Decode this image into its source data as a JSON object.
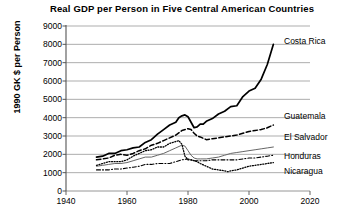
{
  "chart_data": {
    "type": "line",
    "title": "Real  GDP per Person in Five Central American Countries",
    "xlabel": "",
    "ylabel": "1990 GK $ per Person",
    "xlim": [
      1940,
      2020
    ],
    "ylim": [
      0,
      9000
    ],
    "xticks": [
      1940,
      1960,
      1980,
      2000,
      2020
    ],
    "yticks": [
      0,
      1000,
      2000,
      3000,
      4000,
      5000,
      6000,
      7000,
      8000,
      9000
    ],
    "grid": true,
    "legend_position": "right-inline-labels",
    "series": [
      {
        "name": "Costa Rica",
        "style": "solid-thick",
        "color": "#000000",
        "x": [
          1950,
          1952,
          1954,
          1956,
          1958,
          1960,
          1962,
          1964,
          1966,
          1968,
          1970,
          1972,
          1974,
          1976,
          1977,
          1978,
          1979,
          1980,
          1981,
          1982,
          1983,
          1984,
          1985,
          1986,
          1988,
          1990,
          1992,
          1994,
          1996,
          1998,
          2000,
          2002,
          2004,
          2006,
          2008
        ],
        "y": [
          1850,
          1900,
          2050,
          2050,
          2200,
          2250,
          2350,
          2400,
          2650,
          2800,
          3100,
          3350,
          3600,
          3750,
          4000,
          4100,
          4150,
          4050,
          3750,
          3450,
          3500,
          3650,
          3650,
          3800,
          3950,
          4200,
          4350,
          4600,
          4650,
          5150,
          5450,
          5600,
          6100,
          6900,
          8000
        ]
      },
      {
        "name": "Guatemala",
        "style": "dashed",
        "color": "#000000",
        "x": [
          1950,
          1952,
          1954,
          1956,
          1958,
          1960,
          1962,
          1964,
          1966,
          1968,
          1970,
          1972,
          1974,
          1976,
          1978,
          1980,
          1981,
          1982,
          1983,
          1984,
          1986,
          1988,
          1990,
          1992,
          1994,
          1996,
          1998,
          2000,
          2002,
          2004,
          2006,
          2008
        ],
        "y": [
          1700,
          1750,
          1800,
          1950,
          2000,
          1950,
          2050,
          2200,
          2300,
          2500,
          2600,
          2750,
          2900,
          3050,
          3300,
          3400,
          3350,
          3150,
          3000,
          2950,
          2800,
          2850,
          2900,
          2950,
          3000,
          3050,
          3150,
          3250,
          3300,
          3350,
          3450,
          3600
        ]
      },
      {
        "name": "El Salvador",
        "style": "solid-thin",
        "color": "#666666",
        "x": [
          1950,
          1952,
          1954,
          1956,
          1958,
          1960,
          1962,
          1964,
          1966,
          1968,
          1970,
          1972,
          1974,
          1976,
          1978,
          1979,
          1980,
          1981,
          1982,
          1983,
          1984,
          1986,
          1988,
          1990,
          1992,
          1994,
          1996,
          1998,
          2000,
          2002,
          2004,
          2006,
          2008
        ],
        "y": [
          1350,
          1400,
          1450,
          1500,
          1500,
          1550,
          1650,
          1750,
          1850,
          1850,
          1950,
          2050,
          2200,
          2350,
          2500,
          2450,
          2200,
          1950,
          1800,
          1750,
          1750,
          1750,
          1800,
          1850,
          1950,
          2050,
          2100,
          2150,
          2200,
          2250,
          2300,
          2350,
          2400
        ]
      },
      {
        "name": "Honduras",
        "style": "dash-dot",
        "color": "#000000",
        "x": [
          1950,
          1952,
          1954,
          1956,
          1958,
          1960,
          1962,
          1964,
          1966,
          1968,
          1970,
          1972,
          1974,
          1976,
          1978,
          1980,
          1982,
          1984,
          1986,
          1988,
          1990,
          1992,
          1994,
          1996,
          1998,
          2000,
          2002,
          2004,
          2006,
          2008
        ],
        "y": [
          1150,
          1150,
          1150,
          1200,
          1200,
          1250,
          1300,
          1350,
          1450,
          1450,
          1500,
          1500,
          1500,
          1600,
          1700,
          1750,
          1650,
          1650,
          1650,
          1700,
          1700,
          1700,
          1700,
          1700,
          1750,
          1800,
          1800,
          1850,
          1900,
          1950
        ]
      },
      {
        "name": "Nicaragua",
        "style": "dotted",
        "color": "#000000",
        "x": [
          1950,
          1952,
          1954,
          1956,
          1958,
          1960,
          1962,
          1964,
          1966,
          1968,
          1970,
          1972,
          1974,
          1976,
          1977,
          1978,
          1979,
          1980,
          1981,
          1982,
          1983,
          1984,
          1986,
          1988,
          1990,
          1992,
          1993,
          1994,
          1996,
          1998,
          2000,
          2002,
          2004,
          2006,
          2008
        ],
        "y": [
          1400,
          1500,
          1600,
          1600,
          1600,
          1700,
          1900,
          2050,
          2200,
          2250,
          2400,
          2400,
          2600,
          2700,
          2750,
          2550,
          1900,
          1700,
          1700,
          1650,
          1600,
          1500,
          1350,
          1200,
          1150,
          1100,
          1050,
          1100,
          1150,
          1250,
          1350,
          1400,
          1450,
          1500,
          1550
        ]
      }
    ],
    "series_label_positions": [
      {
        "name": "Costa Rica",
        "x": 284,
        "y": 41
      },
      {
        "name": "Guatemala",
        "x": 284,
        "y": 116
      },
      {
        "name": "El Salvador",
        "x": 284,
        "y": 137
      },
      {
        "name": "Honduras",
        "x": 284,
        "y": 156
      },
      {
        "name": "Nicaragua",
        "x": 284,
        "y": 171
      }
    ]
  }
}
